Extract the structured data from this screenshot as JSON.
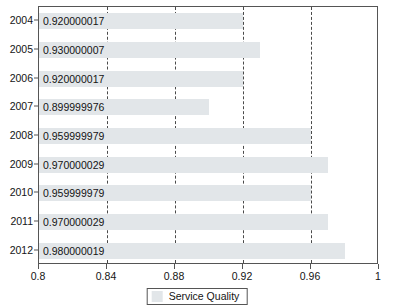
{
  "chart_data": {
    "type": "bar",
    "orientation": "horizontal",
    "title": "",
    "xlabel": "",
    "ylabel": "",
    "categories": [
      "2004",
      "2005",
      "2006",
      "2007",
      "2008",
      "2009",
      "2010",
      "2011",
      "2012"
    ],
    "values": [
      0.920000017,
      0.930000007,
      0.920000017,
      0.899999976,
      0.959999979,
      0.970000029,
      0.959999979,
      0.970000029,
      0.980000019
    ],
    "data_labels": [
      "0.920000017",
      "0.930000007",
      "0.920000017",
      "0.899999976",
      "0.959999979",
      "0.970000029",
      "0.959999979",
      "0.970000029",
      "0.980000019"
    ],
    "series": [
      {
        "name": "Service Quality",
        "color": "#e2e6e9",
        "values": [
          0.920000017,
          0.930000007,
          0.920000017,
          0.899999976,
          0.959999979,
          0.970000029,
          0.959999979,
          0.970000029,
          0.980000019
        ]
      }
    ],
    "xlim": [
      0.8,
      1.0
    ],
    "xticks": [
      0.8,
      0.84,
      0.88,
      0.92,
      0.96,
      1.0
    ],
    "xtick_labels": [
      "0.8",
      "0.84",
      "0.88",
      "0.92",
      "0.96",
      "1"
    ],
    "ytick_labels": [
      "2004",
      "2005",
      "2006",
      "2007",
      "2008",
      "2009",
      "2010",
      "2011",
      "2012"
    ],
    "grid": {
      "vertical": true,
      "horizontal": false,
      "style": "dashed",
      "color": "#4a4a4a"
    },
    "legend": {
      "position": "bottom",
      "entries": [
        {
          "label": "Service Quality",
          "color": "#e2e6e9"
        }
      ]
    },
    "bar_color": "#e2e6e9",
    "frame_color": "#555555"
  },
  "legend": {
    "label": "Service Quality"
  }
}
